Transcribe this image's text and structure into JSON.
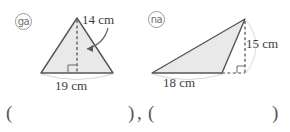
{
  "page": {
    "kind": "math-worksheet-figure",
    "background_color": "#ffffff"
  },
  "figures": [
    {
      "id": "figure-ga",
      "marker": "㉮",
      "marker_reading": "ga",
      "shape": "triangle",
      "orientation": "apex-up",
      "base_label": "19 cm",
      "height_label": "14 cm",
      "height_style": "dashed-interior",
      "right_angle_marker": true,
      "fill_color": "#e9e9e9",
      "stroke_color": "#555555"
    },
    {
      "id": "figure-na",
      "marker": "㉯",
      "marker_reading": "na",
      "shape": "triangle",
      "orientation": "apex-top-right",
      "base_label": "18 cm",
      "height_label": "15 cm",
      "height_style": "dashed-exterior",
      "right_angle_marker": true,
      "fill_color": "#e9e9e9",
      "stroke_color": "#555555"
    }
  ],
  "answer_row": {
    "open_1": "(",
    "close_1": ")",
    "separator": ",",
    "open_2": "(",
    "close_2": ")"
  }
}
